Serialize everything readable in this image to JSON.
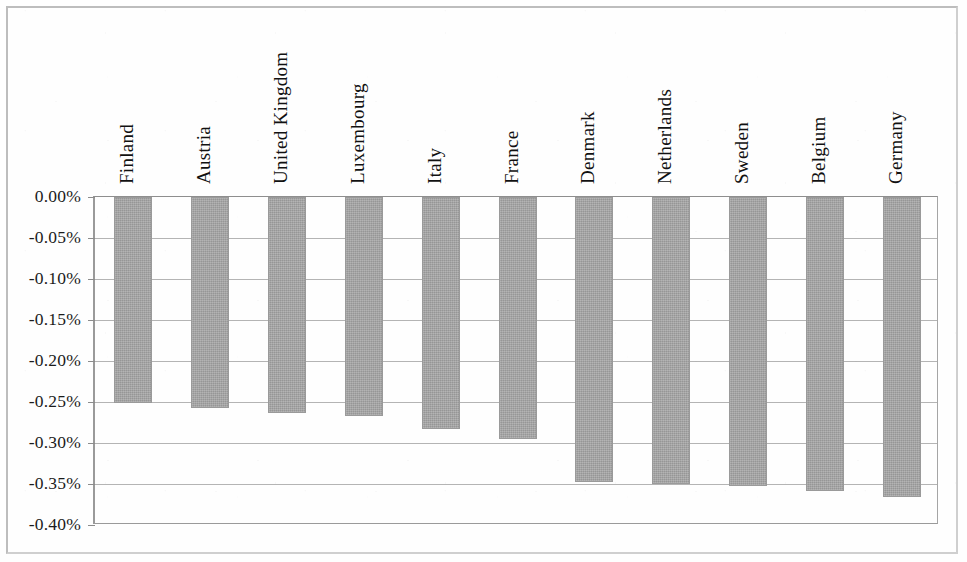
{
  "chart_data": {
    "type": "bar",
    "title": "",
    "subtitle": "",
    "xlabel": "",
    "ylabel": "",
    "categories": [
      "Finland",
      "Austria",
      "United Kingdom",
      "Luxembourg",
      "Italy",
      "France",
      "Denmark",
      "Netherlands",
      "Sweden",
      "Belgium",
      "Germany"
    ],
    "values": [
      -0.251,
      -0.257,
      -0.264,
      -0.2665,
      -0.283,
      -0.295,
      -0.348,
      -0.35,
      -0.352,
      -0.358,
      -0.366
    ],
    "value_format": "percent-2dp",
    "ylim": [
      -0.4,
      0.0
    ],
    "ytick_labels": [
      "0.00%",
      "-0.05%",
      "-0.10%",
      "-0.15%",
      "-0.20%",
      "-0.25%",
      "-0.30%",
      "-0.35%",
      "-0.40%"
    ],
    "ytick_values": [
      0.0,
      -0.05,
      -0.1,
      -0.15,
      -0.2,
      -0.25,
      -0.3,
      -0.35,
      -0.4
    ],
    "grid": true,
    "grid_axis": "y",
    "legend": false,
    "legend_position": "none",
    "bar_color": "#a3a3a3",
    "bar_border_color": "#9a9a9a",
    "axis_color": "#8e8e8e",
    "gridline_color": "#b4b4b4",
    "text_color": "#111111",
    "category_label_rotation": -90,
    "category_label_position": "above-axis",
    "background_color": "#fefefe",
    "frame": true
  },
  "layout": {
    "plot_left_px": 93,
    "plot_top_px": 196,
    "plot_width_px": 845,
    "plot_height_px": 328,
    "bar_width_px": 38,
    "slot_width_px": 76.8
  }
}
